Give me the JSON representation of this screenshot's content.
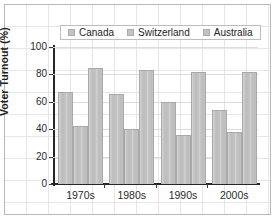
{
  "chart_data": {
    "type": "bar",
    "title": "",
    "xlabel": "",
    "ylabel": "Voter Turnout (%)",
    "categories": [
      "1970s",
      "1980s",
      "1990s",
      "2000s"
    ],
    "series": [
      {
        "name": "Canada",
        "values": [
          67,
          66,
          60,
          54
        ],
        "color": "#c3c3c3"
      },
      {
        "name": "Switzerland",
        "values": [
          42,
          40,
          36,
          38
        ],
        "color": "#c3c3c3"
      },
      {
        "name": "Australia",
        "values": [
          85,
          83,
          82,
          82
        ],
        "color": "#c3c3c3"
      }
    ],
    "ylim": [
      0,
      100
    ],
    "yticks": [
      0,
      20,
      40,
      60,
      80,
      100
    ],
    "ytick_labels": [
      "0",
      "20",
      "40",
      "60",
      "80",
      "100"
    ],
    "grid": true,
    "legend_position": "top-center"
  },
  "legend": {
    "items": [
      {
        "label": "Canada"
      },
      {
        "label": "Switzerland"
      },
      {
        "label": "Australia"
      }
    ]
  },
  "axes": {
    "y_title": "Voter Turnout (%)"
  }
}
